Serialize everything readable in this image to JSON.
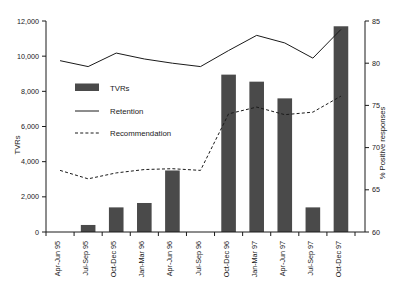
{
  "chart_data": {
    "type": "bar",
    "title": "",
    "xlabel": "",
    "ylabel": "TVRs",
    "y2label": "% Positive responses",
    "ylim": [
      0,
      12000
    ],
    "y2lim": [
      60,
      85
    ],
    "grid": false,
    "legend_position": "upper-left-inside",
    "categories": [
      "Apr-Jun 95",
      "Jul-Sep 95",
      "Oct-Dec 95",
      "Jan-Mar 96",
      "Apr-Jun 96",
      "Jul-Sep 96",
      "Oct-Dec 96",
      "Jan-Mar 97",
      "Apr-Jun 97",
      "Jul-Sep 97",
      "Oct-Dec 97"
    ],
    "y_ticks": [
      "0",
      "2,000",
      "4,000",
      "6,000",
      "8,000",
      "10,000",
      "12,000"
    ],
    "y_tick_values": [
      0,
      2000,
      4000,
      6000,
      8000,
      10000,
      12000
    ],
    "y2_ticks": [
      "60",
      "65",
      "70",
      "75",
      "80",
      "85"
    ],
    "y2_tick_values": [
      60,
      65,
      70,
      75,
      80,
      85
    ],
    "series": [
      {
        "name": "TVRs",
        "type": "bar",
        "axis": "left",
        "color": "#4a4a4a",
        "values": [
          0,
          400,
          1400,
          1650,
          3500,
          0,
          8950,
          8550,
          7600,
          1400,
          11700
        ]
      },
      {
        "name": "Retention",
        "type": "line",
        "axis": "right",
        "color": "#1a1a1a",
        "values": [
          80.3,
          79.6,
          81.2,
          80.5,
          80.0,
          79.6,
          81.5,
          83.3,
          82.4,
          80.6,
          84.0
        ]
      },
      {
        "name": "Recommendation",
        "type": "line-dashed",
        "axis": "right",
        "color": "#1a1a1a",
        "values": [
          67.3,
          66.3,
          67.0,
          67.4,
          67.5,
          67.3,
          74.0,
          74.8,
          73.9,
          74.2,
          76.1
        ]
      }
    ]
  },
  "legend": {
    "items": [
      {
        "label": "TVRs",
        "marker": "bar-swatch"
      },
      {
        "label": "Retention",
        "marker": "solid-line"
      },
      {
        "label": "Recommendation",
        "marker": "dashed-line"
      }
    ]
  }
}
